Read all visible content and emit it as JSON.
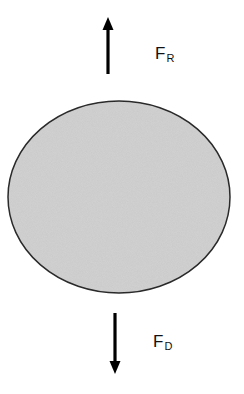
{
  "diagram": {
    "type": "free-body diagram",
    "body": {
      "shape": "ellipse",
      "fill": "#c9c9c9",
      "stroke": "#2a2a2a"
    },
    "forces": [
      {
        "name": "F",
        "subscript": "R",
        "direction": "up"
      },
      {
        "name": "F",
        "subscript": "D",
        "direction": "down"
      }
    ]
  }
}
